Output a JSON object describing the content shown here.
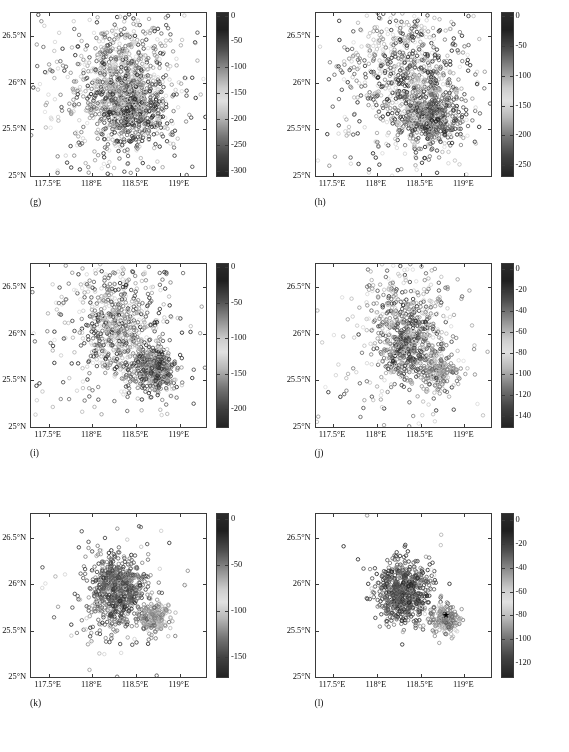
{
  "figure": {
    "panel_count": 6,
    "marker": "open-circle",
    "axis": {
      "x_ticks": [
        117.5,
        118.0,
        118.5,
        119.0
      ],
      "x_tick_labels": [
        "117.5°E",
        "118°E",
        "118.5°E",
        "119°E"
      ],
      "y_ticks": [
        25.0,
        25.5,
        26.0,
        26.5
      ],
      "y_tick_labels": [
        "25°N",
        "25.5°N",
        "26°N",
        "26.5°N"
      ],
      "xlim": [
        117.3,
        119.3
      ],
      "ylim": [
        25.0,
        26.75
      ]
    }
  },
  "chart_data": [
    {
      "type": "scatter",
      "title": "(g)",
      "xlabel": "",
      "ylabel": "",
      "xlim": [
        117.3,
        119.3
      ],
      "ylim": [
        25.0,
        26.75
      ],
      "grid": false,
      "colorbar": {
        "ticks": [
          0,
          -50,
          -100,
          -150,
          -200,
          -250,
          -300
        ],
        "tick_labels": [
          "0",
          "-50",
          "-100",
          "-150",
          "-200",
          "-250",
          "-300"
        ],
        "vmin": -310,
        "vmax": 5,
        "position": "right",
        "label": ""
      },
      "seed": 11,
      "n_points": 1450,
      "clusters": [
        {
          "cx": 118.45,
          "cy": 25.7,
          "sx": 0.2,
          "sy": 0.18,
          "n": 470,
          "depth": -255,
          "ddev": 55
        },
        {
          "cx": 118.32,
          "cy": 25.92,
          "sx": 0.22,
          "sy": 0.22,
          "n": 330,
          "depth": -215,
          "ddev": 60
        },
        {
          "cx": 118.3,
          "cy": 26.3,
          "sx": 0.28,
          "sy": 0.26,
          "n": 230,
          "depth": -150,
          "ddev": 70
        },
        {
          "cx": 118.25,
          "cy": 25.85,
          "sx": 0.55,
          "sy": 0.55,
          "n": 420,
          "depth": -130,
          "ddev": 85
        }
      ]
    },
    {
      "type": "scatter",
      "title": "(h)",
      "xlabel": "",
      "ylabel": "",
      "xlim": [
        117.3,
        119.3
      ],
      "ylim": [
        25.0,
        26.75
      ],
      "grid": false,
      "colorbar": {
        "ticks": [
          0,
          -50,
          -100,
          -150,
          -200,
          -250
        ],
        "tick_labels": [
          "0",
          "-50",
          "-100",
          "-150",
          "-200",
          "-250"
        ],
        "vmin": -268,
        "vmax": 5,
        "position": "right",
        "label": ""
      },
      "seed": 23,
      "n_points": 1380,
      "clusters": [
        {
          "cx": 118.62,
          "cy": 25.62,
          "sx": 0.17,
          "sy": 0.15,
          "n": 430,
          "depth": -215,
          "ddev": 45
        },
        {
          "cx": 118.42,
          "cy": 25.88,
          "sx": 0.23,
          "sy": 0.22,
          "n": 300,
          "depth": -185,
          "ddev": 55
        },
        {
          "cx": 118.3,
          "cy": 26.35,
          "sx": 0.3,
          "sy": 0.25,
          "n": 250,
          "depth": -135,
          "ddev": 65
        },
        {
          "cx": 118.3,
          "cy": 25.85,
          "sx": 0.58,
          "sy": 0.58,
          "n": 400,
          "depth": -120,
          "ddev": 80
        }
      ]
    },
    {
      "type": "scatter",
      "title": "(i)",
      "xlabel": "",
      "ylabel": "",
      "xlim": [
        117.3,
        119.3
      ],
      "ylim": [
        25.0,
        26.75
      ],
      "grid": false,
      "colorbar": {
        "ticks": [
          0,
          -50,
          -100,
          -150,
          -200
        ],
        "tick_labels": [
          "0",
          "-50",
          "-100",
          "-150",
          "-200"
        ],
        "vmin": -225,
        "vmax": 5,
        "position": "right",
        "label": ""
      },
      "seed": 37,
      "n_points": 1150,
      "clusters": [
        {
          "cx": 118.72,
          "cy": 25.62,
          "sx": 0.13,
          "sy": 0.12,
          "n": 380,
          "depth": -175,
          "ddev": 30
        },
        {
          "cx": 118.3,
          "cy": 25.95,
          "sx": 0.22,
          "sy": 0.24,
          "n": 320,
          "depth": -150,
          "ddev": 50
        },
        {
          "cx": 118.25,
          "cy": 26.38,
          "sx": 0.26,
          "sy": 0.22,
          "n": 200,
          "depth": -110,
          "ddev": 55
        },
        {
          "cx": 118.25,
          "cy": 25.85,
          "sx": 0.55,
          "sy": 0.55,
          "n": 250,
          "depth": -100,
          "ddev": 65
        }
      ]
    },
    {
      "type": "scatter",
      "title": "(j)",
      "xlabel": "",
      "ylabel": "",
      "xlim": [
        117.3,
        119.3
      ],
      "ylim": [
        25.0,
        26.75
      ],
      "grid": false,
      "colorbar": {
        "ticks": [
          0,
          -20,
          -40,
          -60,
          -80,
          -100,
          -120,
          -140
        ],
        "tick_labels": [
          "0",
          "-20",
          "-40",
          "-60",
          "-80",
          "-100",
          "-120",
          "-140"
        ],
        "vmin": -150,
        "vmax": 5,
        "position": "right",
        "label": ""
      },
      "seed": 53,
      "n_points": 980,
      "clusters": [
        {
          "cx": 118.35,
          "cy": 25.92,
          "sx": 0.17,
          "sy": 0.19,
          "n": 470,
          "depth": -118,
          "ddev": 18
        },
        {
          "cx": 118.7,
          "cy": 25.6,
          "sx": 0.11,
          "sy": 0.1,
          "n": 140,
          "depth": -48,
          "ddev": 12
        },
        {
          "cx": 118.3,
          "cy": 26.35,
          "sx": 0.28,
          "sy": 0.22,
          "n": 160,
          "depth": -80,
          "ddev": 28
        },
        {
          "cx": 118.3,
          "cy": 25.8,
          "sx": 0.52,
          "sy": 0.5,
          "n": 210,
          "depth": -85,
          "ddev": 32
        }
      ]
    },
    {
      "type": "scatter",
      "title": "(k)",
      "xlabel": "",
      "ylabel": "",
      "xlim": [
        117.3,
        119.3
      ],
      "ylim": [
        25.0,
        26.75
      ],
      "grid": false,
      "colorbar": {
        "ticks": [
          0,
          -50,
          -100,
          -150
        ],
        "tick_labels": [
          "0",
          "-50",
          "-100",
          "-150"
        ],
        "vmin": -172,
        "vmax": 5,
        "position": "right",
        "label": ""
      },
      "seed": 71,
      "n_points": 900,
      "clusters": [
        {
          "cx": 118.28,
          "cy": 25.93,
          "sx": 0.15,
          "sy": 0.18,
          "n": 560,
          "depth": -140,
          "ddev": 14
        },
        {
          "cx": 118.72,
          "cy": 25.62,
          "sx": 0.085,
          "sy": 0.085,
          "n": 170,
          "depth": -118,
          "ddev": 10
        },
        {
          "cx": 118.28,
          "cy": 25.9,
          "sx": 0.28,
          "sy": 0.3,
          "n": 130,
          "depth": -132,
          "ddev": 22
        },
        {
          "cx": 118.2,
          "cy": 25.85,
          "sx": 0.55,
          "sy": 0.55,
          "n": 40,
          "depth": -128,
          "ddev": 28
        }
      ]
    },
    {
      "type": "scatter",
      "title": "(l)",
      "xlabel": "",
      "ylabel": "",
      "xlim": [
        117.3,
        119.3
      ],
      "ylim": [
        25.0,
        26.75
      ],
      "grid": false,
      "colorbar": {
        "ticks": [
          0,
          -20,
          -40,
          -60,
          -80,
          -100,
          -120
        ],
        "tick_labels": [
          "0",
          "-20",
          "-40",
          "-60",
          "-80",
          "-100",
          "-120"
        ],
        "vmin": -132,
        "vmax": 5,
        "position": "right",
        "label": ""
      },
      "seed": 97,
      "n_points": 860,
      "marker_star": {
        "x": 118.79,
        "y": 25.67,
        "symbol": "★"
      },
      "clusters": [
        {
          "cx": 118.3,
          "cy": 25.92,
          "sx": 0.145,
          "sy": 0.165,
          "n": 580,
          "depth": -112,
          "ddev": 12
        },
        {
          "cx": 118.78,
          "cy": 25.62,
          "sx": 0.085,
          "sy": 0.08,
          "n": 180,
          "depth": -44,
          "ddev": 9
        },
        {
          "cx": 118.3,
          "cy": 25.92,
          "sx": 0.24,
          "sy": 0.26,
          "n": 90,
          "depth": -105,
          "ddev": 18
        },
        {
          "cx": 118.3,
          "cy": 25.9,
          "sx": 0.38,
          "sy": 0.38,
          "n": 10,
          "depth": -100,
          "ddev": 20
        }
      ]
    }
  ]
}
